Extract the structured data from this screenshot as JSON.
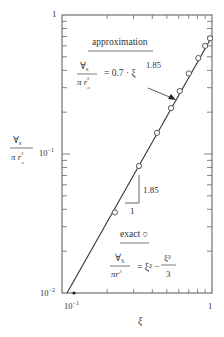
{
  "chart_data": {
    "type": "line",
    "title": "",
    "xlabel": "ξ",
    "ylabel": "∀s / π r_o³",
    "xscale": "log",
    "yscale": "log",
    "xlim": [
      0.1,
      1
    ],
    "ylim": [
      0.01,
      1
    ],
    "grid": false,
    "x_ticks": [
      {
        "value": 0.1,
        "label": "10⁻¹"
      },
      {
        "value": 1,
        "label": "1"
      }
    ],
    "y_ticks": [
      {
        "value": 0.01,
        "label": "10⁻²"
      },
      {
        "value": 0.1,
        "label": "10⁻¹"
      },
      {
        "value": 1,
        "label": "1"
      }
    ],
    "series": [
      {
        "name": "approximation",
        "style": "solid line",
        "formula": "0.7 · ξ^1.85",
        "x": [
          0.108,
          1.0
        ],
        "y": [
          0.01,
          0.7
        ]
      },
      {
        "name": "exact",
        "style": "open circles",
        "formula": "ξ² − ξ³/3",
        "x": [
          0.225,
          0.326,
          0.43,
          0.533,
          0.61,
          0.7,
          0.81,
          0.9,
          0.97
        ],
        "y": [
          0.038,
          0.082,
          0.142,
          0.214,
          0.284,
          0.38,
          0.49,
          0.6,
          0.68
        ]
      }
    ],
    "annotations": [
      {
        "text": "approximation",
        "underlined": true
      },
      {
        "text": "∀s / π r_o³ = 0.7 · ξ^1.85"
      },
      {
        "text": "exact ○",
        "underlined": true
      },
      {
        "text": "∀s / π r_o³ = ξ² − ξ³/3"
      },
      {
        "text": "slope triangle: 1 (run), 1.85 (rise)"
      }
    ]
  },
  "labels": {
    "y_top": "1",
    "y_mid": "10",
    "y_mid_exp": "−1",
    "y_bot": "10",
    "y_bot_exp": "−2",
    "x_left": "10",
    "x_left_exp": "−1",
    "x_right": "1",
    "x_axis": "ξ",
    "y_axis_num": "∀",
    "y_axis_num_sub": "s",
    "y_axis_den": "π r",
    "y_axis_den_sub": "o",
    "y_axis_den_sup": "3",
    "approx_title": "approximation",
    "approx_lhs_num": "∀",
    "approx_lhs_num_sub": "s",
    "approx_lhs_den": "π r",
    "approx_lhs_den_sub": "o",
    "approx_lhs_den_sup": "3",
    "approx_rhs": "= 0.7 · ξ",
    "approx_exp": "1.85",
    "exact_title": "exact ○",
    "exact_lhs_num": "∀",
    "exact_lhs_num_sub": "S",
    "exact_lhs_den": "πr",
    "exact_lhs_den_sub": "o",
    "exact_lhs_den_sup": "3",
    "exact_rhs": "= ξ² −",
    "exact_frac_num": "ξ³",
    "exact_frac_den": "3",
    "slope_run": "1",
    "slope_rise": "1.85"
  }
}
